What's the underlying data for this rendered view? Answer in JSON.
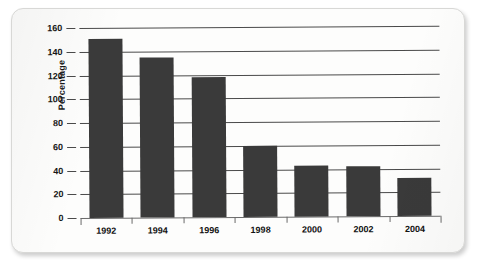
{
  "chart_data": {
    "type": "bar",
    "title": "",
    "subtitle": "",
    "xlabel": "",
    "ylabel": "Percentage",
    "categories": [
      "1992",
      "1994",
      "1996",
      "1998",
      "2000",
      "2002",
      "2004"
    ],
    "values": [
      151,
      135,
      118,
      60,
      43,
      42,
      32
    ],
    "series": [
      {
        "name": "Percentage",
        "values": [
          151,
          135,
          118,
          60,
          43,
          42,
          32
        ]
      }
    ],
    "ylim": [
      0,
      160
    ],
    "ytick_labels": [
      "0",
      "20",
      "40",
      "60",
      "80",
      "100",
      "120",
      "140",
      "160"
    ],
    "ytick_values": [
      0,
      20,
      40,
      60,
      80,
      100,
      120,
      140,
      160
    ],
    "ytick_step": 20,
    "grid": true,
    "grid_axis": "y",
    "legend": false,
    "legend_position": "none",
    "annotations": [],
    "bar_color": "#3a3a3a",
    "gridline_color": "#4a4a4a",
    "background_color": "#fdfdfc",
    "text_color": "#161616"
  }
}
